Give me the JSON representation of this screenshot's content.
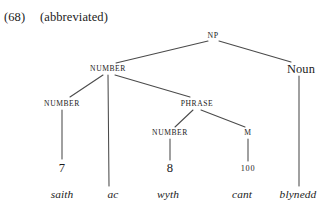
{
  "header": {
    "example_number": "(68)",
    "note": "(abbreviated)"
  },
  "colors": {
    "ink": "#1b1b1b",
    "line": "#4a4a4a",
    "background": "#ffffff"
  },
  "tree": {
    "root_label": "NP",
    "nodes": [
      {
        "id": "np",
        "label": "NP",
        "style": "smallcaps",
        "x": 213,
        "y": 36
      },
      {
        "id": "number1",
        "label": "NUMBER",
        "style": "smallcaps",
        "x": 108,
        "y": 69
      },
      {
        "id": "noun",
        "label": "Noun",
        "style": "mixed",
        "x": 301,
        "y": 69
      },
      {
        "id": "number2",
        "label": "NUMBER",
        "style": "smallcaps",
        "x": 62,
        "y": 104
      },
      {
        "id": "phrase",
        "label": "PHRASE",
        "style": "smallcaps",
        "x": 197,
        "y": 104
      },
      {
        "id": "number3",
        "label": "NUMBER",
        "style": "smallcaps",
        "x": 170,
        "y": 133
      },
      {
        "id": "m",
        "label": "M",
        "style": "smallcaps",
        "x": 248,
        "y": 133
      }
    ],
    "numerals": [
      {
        "id": "seven",
        "label": "7",
        "style": "lining",
        "x": 62,
        "y": 168
      },
      {
        "id": "eight",
        "label": "8",
        "style": "lining",
        "x": 170,
        "y": 168
      },
      {
        "id": "hundred",
        "label": "100",
        "style": "oldstyle",
        "x": 248,
        "y": 169
      }
    ],
    "words": [
      {
        "id": "saith",
        "label": "saith",
        "x": 62,
        "y": 195
      },
      {
        "id": "ac",
        "label": "ac",
        "x": 113,
        "y": 195
      },
      {
        "id": "wyth",
        "label": "wyth",
        "x": 168,
        "y": 195
      },
      {
        "id": "cant",
        "label": "cant",
        "x": 242,
        "y": 195
      },
      {
        "id": "blynedd",
        "label": "blynedd",
        "x": 298,
        "y": 195
      }
    ],
    "edges": [
      {
        "id": "np-number1",
        "from": "np",
        "to": "number1",
        "x1": 208,
        "y1": 41,
        "x2": 116,
        "y2": 63
      },
      {
        "id": "np-noun",
        "from": "np",
        "to": "noun",
        "x1": 219,
        "y1": 41,
        "x2": 291,
        "y2": 62
      },
      {
        "id": "number1-number2",
        "from": "number1",
        "to": "number2",
        "x1": 103,
        "y1": 75,
        "x2": 70,
        "y2": 97
      },
      {
        "id": "number1-ac",
        "from": "number1",
        "to": "ac",
        "x1": 108,
        "y1": 75,
        "x2": 109,
        "y2": 186
      },
      {
        "id": "number1-phrase",
        "from": "number1",
        "to": "phrase",
        "x1": 115,
        "y1": 75,
        "x2": 190,
        "y2": 97
      },
      {
        "id": "number2-seven",
        "from": "number2",
        "to": "seven",
        "x1": 62,
        "y1": 110,
        "x2": 62,
        "y2": 159
      },
      {
        "id": "phrase-number3",
        "from": "phrase",
        "to": "number3",
        "x1": 193,
        "y1": 110,
        "x2": 175,
        "y2": 127
      },
      {
        "id": "phrase-m",
        "from": "phrase",
        "to": "m",
        "x1": 201,
        "y1": 110,
        "x2": 245,
        "y2": 127
      },
      {
        "id": "number3-eight",
        "from": "number3",
        "to": "eight",
        "x1": 170,
        "y1": 139,
        "x2": 170,
        "y2": 160
      },
      {
        "id": "m-hundred",
        "from": "m",
        "to": "hundred",
        "x1": 248,
        "y1": 139,
        "x2": 248,
        "y2": 161
      },
      {
        "id": "noun-blynedd",
        "from": "noun",
        "to": "blynedd",
        "x1": 299,
        "y1": 76,
        "x2": 299,
        "y2": 186
      }
    ]
  }
}
